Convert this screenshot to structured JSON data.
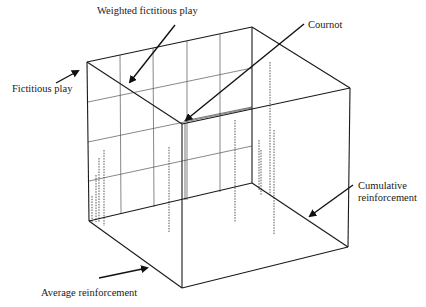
{
  "labels": {
    "weighted_fictitious_play": "Weighted fictitious play",
    "cournot": "Cournot",
    "fictitious_play": "Fictitious play",
    "cumulative_reinforcement_line1": "Cumulative",
    "cumulative_reinforcement_line2": "reinforcement",
    "average_reinforcement": "Average reinforcement"
  },
  "colors": {
    "line": "#1a1a1a",
    "grid": "#555555",
    "dashed": "#444444",
    "background": "#ffffff"
  },
  "cube": {
    "back_top_left": [
      87,
      62
    ],
    "back_top_right": [
      252,
      27
    ],
    "front_top_left": [
      182,
      124
    ],
    "front_top_right": [
      350,
      88
    ],
    "back_bottom_left": [
      89,
      221
    ],
    "back_bottom_right": [
      252,
      183
    ],
    "front_bottom_left": [
      182,
      288
    ],
    "front_bottom_right": [
      348,
      247
    ]
  },
  "dashed_lines": [
    {
      "x": 92,
      "y1": 196,
      "y2": 222
    },
    {
      "x": 96,
      "y1": 175,
      "y2": 222
    },
    {
      "x": 99,
      "y1": 158,
      "y2": 222
    },
    {
      "x": 104,
      "y1": 150,
      "y2": 226
    },
    {
      "x": 169,
      "y1": 147,
      "y2": 232
    },
    {
      "x": 235,
      "y1": 120,
      "y2": 222
    },
    {
      "x": 259,
      "y1": 140,
      "y2": 190
    },
    {
      "x": 261,
      "y1": 150,
      "y2": 195
    },
    {
      "x": 270,
      "y1": 62,
      "y2": 195
    },
    {
      "x": 274,
      "y1": 130,
      "y2": 235
    }
  ]
}
